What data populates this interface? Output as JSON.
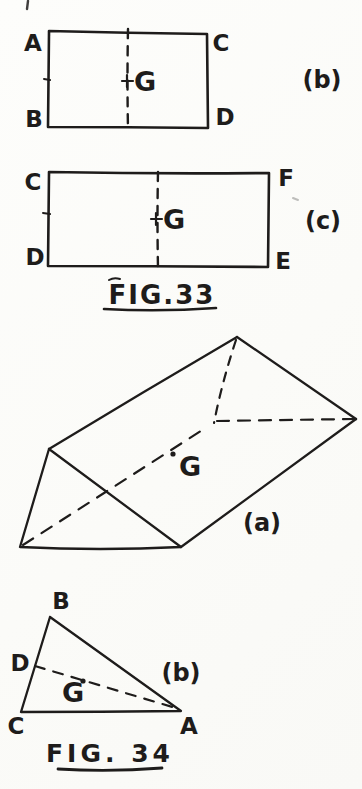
{
  "page": {
    "paper_color": "#fcfcfa",
    "ink_color": "#1e1c1b"
  },
  "fig33": {
    "caption": "FIG.33",
    "rect_b": {
      "corner_tl": "A",
      "corner_tr": "C",
      "corner_bl": "B",
      "corner_br": "D",
      "centroid_label": "G",
      "part_label": "(b)"
    },
    "rect_c": {
      "corner_tl": "C",
      "corner_tr": "F",
      "corner_bl": "D",
      "corner_br": "E",
      "centroid_label": "G",
      "part_label": "(c)"
    }
  },
  "fig34": {
    "caption": "FIG. 34",
    "prism": {
      "centroid_label": "G",
      "part_label": "(a)"
    },
    "triangle": {
      "vertex_top": "B",
      "vertex_bottom_left": "C",
      "vertex_bottom_right": "A",
      "side_midpoint_label": "D",
      "centroid_label": "G",
      "part_label": "(b)"
    }
  }
}
